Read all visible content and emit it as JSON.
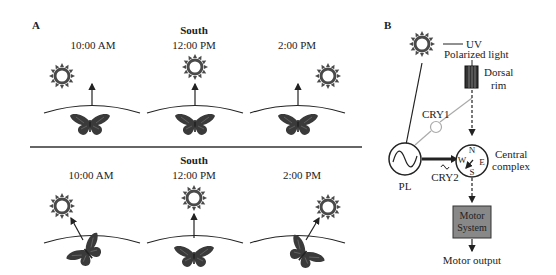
{
  "panel_a": {
    "label": "A",
    "top_row": {
      "heading": "South",
      "times": [
        "10:00 AM",
        "12:00 PM",
        "2:00 PM"
      ]
    },
    "bottom_row": {
      "heading": "South",
      "times": [
        "10:00 AM",
        "12:00 PM",
        "2:00 PM"
      ]
    }
  },
  "panel_b": {
    "label": "B",
    "uv_label": "UV",
    "polarized_label": "Polarized light",
    "dorsal_label_1": "Dorsal",
    "dorsal_label_2": "rim",
    "cry1_label": "CRY1",
    "cry2_label": "CRY2",
    "pl_label": "PL",
    "compass": {
      "n": "N",
      "e": "E",
      "s": "S",
      "w": "W"
    },
    "central_label_1": "Central",
    "central_label_2": "complex",
    "motor_box_1": "Motor",
    "motor_box_2": "System",
    "motor_output_label": "Motor output"
  },
  "colors": {
    "ink": "#222222",
    "sun": "#4a4a4a",
    "butterfly": "#3a3a3a",
    "cry1_line": "#aaaaaa",
    "motor_box": "#888888"
  }
}
